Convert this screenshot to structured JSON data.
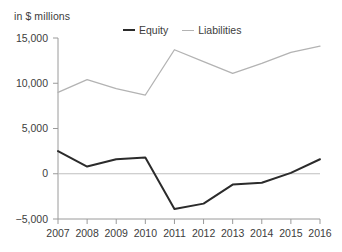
{
  "chart_data": {
    "type": "line",
    "title": "",
    "subtitle": "",
    "unit_label": "in $ millions",
    "xlabel": "",
    "ylabel": "",
    "categories": [
      "2007",
      "2008",
      "2009",
      "2010",
      "2011",
      "2012",
      "2013",
      "2014",
      "2015",
      "2016"
    ],
    "series": [
      {
        "name": "Equity",
        "color": "#2b2b2b",
        "values": [
          2500,
          800,
          1600,
          1800,
          -3900,
          -3300,
          -1200,
          -1000,
          100,
          1600
        ]
      },
      {
        "name": "Liabilities",
        "color": "#b3b3b3",
        "values": [
          9000,
          10400,
          9400,
          8700,
          13700,
          12400,
          11100,
          12200,
          13400,
          14100
        ]
      }
    ],
    "ylim": [
      -5000,
      15000
    ],
    "yticks": [
      -5000,
      0,
      5000,
      10000,
      15000
    ],
    "ytick_labels": [
      "−5,000",
      "0",
      "5,000",
      "10,000",
      "15,000"
    ],
    "grid": false,
    "zero_line": true,
    "zero_line_color": "#bfbfbf",
    "legend_position": "top-center"
  },
  "legend": {
    "items": [
      {
        "label": "Equity",
        "color": "#2b2b2b"
      },
      {
        "label": "Liabilities",
        "color": "#b3b3b3"
      }
    ]
  },
  "axes": {
    "axis_color": "#9a9a9a",
    "tick_color": "#9a9a9a",
    "text_color": "#3c3c3c"
  }
}
